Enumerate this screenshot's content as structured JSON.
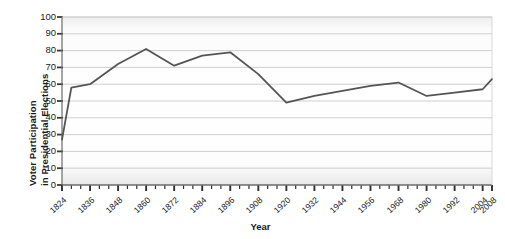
{
  "chart_data": {
    "type": "line",
    "title": "",
    "xlabel": "Year",
    "ylabel": "Voter Participation in Presidential Elections",
    "ylabel_line1": "Voter Participation",
    "ylabel_line2": "in Presidential Elections",
    "xlim": [
      1824,
      2008
    ],
    "ylim": [
      0,
      100
    ],
    "grid": true,
    "legend": "none",
    "line_color": "#555555",
    "grid_color": "#c9c9c9",
    "axis_color": "#6b6b6b",
    "yticks": [
      0,
      10,
      20,
      30,
      40,
      50,
      60,
      70,
      80,
      90,
      100
    ],
    "ytick_labels": [
      "0",
      "10",
      "20",
      "30",
      "40",
      "50",
      "60",
      "70",
      "80",
      "90",
      "100"
    ],
    "xtick_labels": [
      "1824",
      "1836",
      "1848",
      "1860",
      "1872",
      "1884",
      "1896",
      "1908",
      "1920",
      "1932",
      "1944",
      "1956",
      "1968",
      "1980",
      "1992",
      "2004",
      "2008"
    ],
    "xtick_years": [
      1824,
      1836,
      1848,
      1860,
      1872,
      1884,
      1896,
      1908,
      1920,
      1932,
      1944,
      1956,
      1968,
      1980,
      1992,
      2004,
      2008
    ],
    "minor_tick_interval_years": 4,
    "x": [
      1824,
      1828,
      1836,
      1848,
      1860,
      1872,
      1884,
      1896,
      1908,
      1920,
      1932,
      1944,
      1956,
      1968,
      1980,
      1992,
      2004,
      2008
    ],
    "values": [
      27,
      58,
      60,
      72,
      81,
      71,
      77,
      79,
      66,
      49,
      53,
      56,
      59,
      61,
      53,
      55,
      57,
      63
    ],
    "series": [
      {
        "name": "Voter Participation",
        "points": [
          {
            "year": 1824,
            "value": 27
          },
          {
            "year": 1828,
            "value": 58
          },
          {
            "year": 1836,
            "value": 60
          },
          {
            "year": 1848,
            "value": 72
          },
          {
            "year": 1860,
            "value": 81
          },
          {
            "year": 1872,
            "value": 71
          },
          {
            "year": 1884,
            "value": 77
          },
          {
            "year": 1896,
            "value": 79
          },
          {
            "year": 1908,
            "value": 66
          },
          {
            "year": 1920,
            "value": 49
          },
          {
            "year": 1932,
            "value": 53
          },
          {
            "year": 1944,
            "value": 56
          },
          {
            "year": 1956,
            "value": 59
          },
          {
            "year": 1968,
            "value": 61
          },
          {
            "year": 1980,
            "value": 53
          },
          {
            "year": 1992,
            "value": 55
          },
          {
            "year": 2004,
            "value": 57
          },
          {
            "year": 2008,
            "value": 63
          }
        ]
      }
    ]
  }
}
